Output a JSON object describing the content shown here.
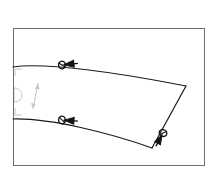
{
  "drawing": {
    "title": "Tapered curved band technical drawing",
    "background_color": "#ffffff",
    "frame": {
      "name": "outer-frame",
      "stroke_color": "#6e6e6e",
      "stroke_width": 1,
      "x": 13,
      "y": 28,
      "width": 191,
      "height": 137
    },
    "shape": {
      "name": "tapered-band",
      "stroke_color": "#1a1a1a",
      "stroke_width": 1.2,
      "fill": "none",
      "top_edge": {
        "name": "top-curve",
        "start": [
          13,
          67
        ],
        "control_1": [
          45,
          62
        ],
        "control_2": [
          120,
          73
        ],
        "end": [
          186,
          86
        ]
      },
      "right_edge": {
        "name": "right-diagonal-edge",
        "start": [
          186,
          86
        ],
        "end": [
          152,
          148
        ]
      },
      "bottom_edge": {
        "name": "bottom-curve",
        "start": [
          13,
          119
        ],
        "control_1": [
          50,
          118
        ],
        "control_2": [
          110,
          133
        ],
        "end": [
          152,
          148
        ]
      }
    },
    "markers": [
      {
        "name": "marker-top-curve",
        "type": "arrow-left-marker",
        "x": 62,
        "y": 65,
        "angle": -6,
        "color": "#141414"
      },
      {
        "name": "marker-bottom-curve",
        "type": "arrow-left-marker",
        "x": 62,
        "y": 120,
        "angle": 4,
        "color": "#141414"
      },
      {
        "name": "marker-right-edge",
        "type": "arrow-down-marker",
        "x": 163,
        "y": 133,
        "angle": 62,
        "color": "#141414"
      }
    ],
    "annotation_block": {
      "name": "section-annotation",
      "stroke_color": "#c6c6c6",
      "corner_brackets": [
        {
          "name": "bracket-top-left",
          "x": 15,
          "y": 69
        },
        {
          "name": "bracket-bottom-left",
          "x": 15,
          "y": 115
        }
      ],
      "glyphs": [
        {
          "name": "half-disc-glyph",
          "cx": 20,
          "cy": 95,
          "r": 7
        },
        {
          "name": "dimension-arrow-glyph",
          "x1": 37,
          "y1": 84,
          "x2": 33,
          "y2": 108
        }
      ]
    }
  },
  "labels": {
    "figure_caption": "",
    "frame_label": "",
    "units": ""
  }
}
